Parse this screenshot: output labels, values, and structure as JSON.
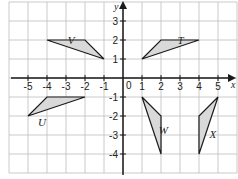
{
  "diagram": {
    "type": "coordinate-grid-transformations",
    "axes": {
      "x_label": "x",
      "y_label": "y",
      "origin_label": "0",
      "x_ticks": [
        "-5",
        "-4",
        "-3",
        "-2",
        "-1",
        "1",
        "2",
        "3",
        "4",
        "5"
      ],
      "y_ticks": [
        "3",
        "2",
        "1",
        "-1",
        "-2",
        "-3",
        "-4"
      ],
      "x_range": [
        -6,
        6
      ],
      "y_range": [
        -5,
        4
      ]
    },
    "colors": {
      "grid": "#bdbdbd",
      "axis": "#1a1a1a",
      "shape_fill": "#d9d9d9",
      "shape_stroke": "#1a1a1a"
    },
    "shapes": [
      {
        "label": "T",
        "vertices": [
          [
            1,
            1
          ],
          [
            2,
            2
          ],
          [
            4,
            2
          ]
        ]
      },
      {
        "label": "V",
        "vertices": [
          [
            -1,
            1
          ],
          [
            -2,
            2
          ],
          [
            -4,
            2
          ]
        ]
      },
      {
        "label": "U",
        "vertices": [
          [
            -5,
            -2
          ],
          [
            -4,
            -1
          ],
          [
            -2,
            -1
          ]
        ]
      },
      {
        "label": "W",
        "vertices": [
          [
            1,
            -1
          ],
          [
            2,
            -2
          ],
          [
            2,
            -4
          ]
        ]
      },
      {
        "label": "X",
        "vertices": [
          [
            5,
            -1
          ],
          [
            4,
            -2
          ],
          [
            4,
            -4
          ]
        ]
      }
    ]
  }
}
